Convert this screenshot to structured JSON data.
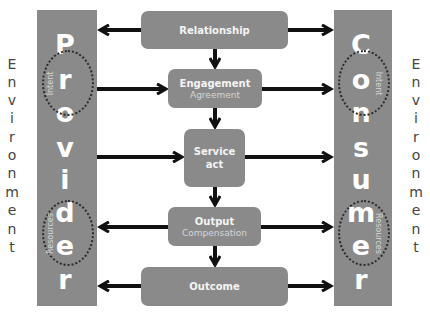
{
  "diagram": {
    "provider": {
      "label": "Provider",
      "letters": [
        "P",
        "r",
        "o",
        "v",
        "i",
        "d",
        "e",
        "r"
      ],
      "intent_label": "Intent",
      "resources_label": "Resources"
    },
    "consumer": {
      "label": "Consumer",
      "letters": [
        "C",
        "o",
        "n",
        "s",
        "u",
        "m",
        "e",
        "r"
      ],
      "intent_label": "Intent",
      "resources_label": "Resources"
    },
    "environment": {
      "label": "Environment",
      "letters": [
        "E",
        "n",
        "v",
        "i",
        "r",
        "o",
        "n",
        "m",
        "e",
        "n",
        "t"
      ]
    },
    "boxes": [
      {
        "id": "relationship",
        "title": "Relationship",
        "subtitle": ""
      },
      {
        "id": "engagement",
        "title": "Engagement",
        "subtitle": "Agreement"
      },
      {
        "id": "service-act",
        "title": "Service act",
        "title_lines": [
          "Service",
          "act"
        ],
        "subtitle": ""
      },
      {
        "id": "output",
        "title": "Output",
        "subtitle": "Compensation"
      },
      {
        "id": "outcome",
        "title": "Outcome",
        "subtitle": ""
      }
    ],
    "connections": [
      {
        "from": "relationship",
        "to": "provider",
        "direction": "both-sides-outward"
      },
      {
        "from": "provider",
        "to": "engagement",
        "direction": "into-box",
        "then": "engagement-to-consumer"
      },
      {
        "from": "provider",
        "to": "service-act",
        "direction": "into-box",
        "then": "service-act-to-consumer"
      },
      {
        "from": "output",
        "to": "provider,consumer",
        "direction": "both-sides-outward"
      },
      {
        "from": "outcome",
        "to": "provider,consumer",
        "direction": "both-sides-outward"
      }
    ],
    "colors": {
      "bar": "#8a8a8a",
      "box": "#8a8a8a",
      "arrow": "#111111",
      "letter": "#ffffff",
      "ellipse_border": "#2a2a2a"
    }
  }
}
